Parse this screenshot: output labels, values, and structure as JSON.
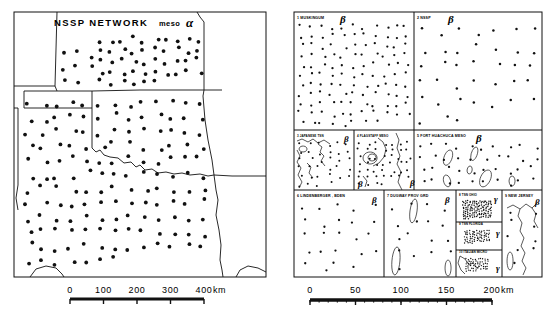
{
  "figure": {
    "kind": "two-panel seismic network station map figure",
    "left": {
      "title": "NSSP NETWORK",
      "meso_word": "meso",
      "greek": "α",
      "scale": {
        "labels": [
          "0",
          "100",
          "200",
          "300",
          "400"
        ],
        "unit": "km",
        "max_km": 400,
        "tick_km": 100
      }
    },
    "right": {
      "scale": {
        "labels": [
          "0",
          "50",
          "100",
          "150",
          "200"
        ],
        "unit": "km",
        "max_km": 200,
        "tick_km": 50,
        "minor_tick_km": 10
      },
      "panels": [
        {
          "id": 1,
          "label": "1 MUSKINGUM",
          "greek": "β",
          "stations": 118
        },
        {
          "id": 2,
          "label": "2 NSSP",
          "greek": "β",
          "stations": 38
        },
        {
          "id": 3,
          "label": "3 JAPANESE  TSN",
          "greek": "β",
          "stations": 34
        },
        {
          "id": 4,
          "label": "4 FLAGSTAFF MESO",
          "greek": "β",
          "stations": 46
        },
        {
          "id": 5,
          "label": "5 FORT HUACHUCA MESO",
          "greek": "β",
          "stations": 40
        },
        {
          "id": 6,
          "label": "6 LINDENBERGER , BDEN",
          "greek": "β",
          "stations": 24
        },
        {
          "id": 7,
          "label": "7 DUGWAY PROV GRD",
          "greek": "β",
          "stations": 17
        },
        {
          "id": 8,
          "label": "8 TSN OHIO",
          "greek": "γ",
          "stations": 120
        },
        {
          "id": 9,
          "label": "9 NEW JERSEY",
          "greek": "β",
          "stations": 9
        },
        {
          "id": 10,
          "label": "9 TSN FLORIDA",
          "greek": "γ",
          "stations": 70
        },
        {
          "id": 11,
          "label": "10 ITALIAN MICRO",
          "greek": "γ",
          "stations": 55
        }
      ]
    }
  },
  "colors": {
    "ink": "#111111",
    "paper": "#ffffff"
  }
}
